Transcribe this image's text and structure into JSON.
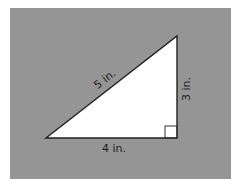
{
  "diagram": {
    "type": "right-triangle",
    "background_color": "#959595",
    "triangle_fill": "#ffffff",
    "stroke_color": "#222222",
    "vertices": {
      "left": [
        46,
        138
      ],
      "top_right": [
        177,
        36
      ],
      "bottom_right": [
        177,
        138
      ]
    },
    "labels": {
      "hypotenuse": "5 in.",
      "vertical_leg": "3 in.",
      "horizontal_leg": "4 in."
    },
    "right_angle_marker": true
  }
}
